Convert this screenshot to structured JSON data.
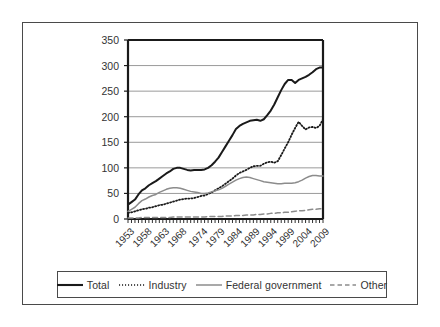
{
  "chart_data": {
    "type": "line",
    "title": "",
    "subtitle": "",
    "xlabel": "",
    "ylabel": "",
    "xlim": [
      1953,
      2009
    ],
    "ylim": [
      0,
      350
    ],
    "ytick_values": [
      0,
      50,
      100,
      150,
      200,
      250,
      300,
      350
    ],
    "ytick_labels": [
      "0",
      "50",
      "100",
      "150",
      "200",
      "250",
      "300",
      "350"
    ],
    "xtick_labels": [
      "1953",
      "1958",
      "1963",
      "1968",
      "1974",
      "1979",
      "1984",
      "1989",
      "1994",
      "1999",
      "2004",
      "2009"
    ],
    "xtick_values": [
      1953,
      1958,
      1963,
      1968,
      1974,
      1979,
      1984,
      1989,
      1994,
      1999,
      2004,
      2009
    ],
    "grid": "horizontal",
    "legend_position": "below",
    "x": [
      1953,
      1954,
      1955,
      1956,
      1957,
      1958,
      1959,
      1960,
      1961,
      1962,
      1963,
      1964,
      1965,
      1966,
      1967,
      1968,
      1969,
      1970,
      1971,
      1972,
      1973,
      1974,
      1975,
      1976,
      1977,
      1978,
      1979,
      1980,
      1981,
      1982,
      1983,
      1984,
      1985,
      1986,
      1987,
      1988,
      1989,
      1990,
      1991,
      1992,
      1993,
      1994,
      1995,
      1996,
      1997,
      1998,
      1999,
      2000,
      2001,
      2002,
      2003,
      2004,
      2005,
      2006,
      2007,
      2008,
      2009
    ],
    "series": [
      {
        "name": "Total",
        "style": "solid",
        "color": "#1a1a1a",
        "width": 2.0,
        "values": [
          28,
          33,
          38,
          48,
          56,
          60,
          66,
          70,
          74,
          79,
          84,
          89,
          93,
          98,
          100,
          100,
          98,
          96,
          95,
          96,
          96,
          96,
          97,
          100,
          105,
          112,
          120,
          131,
          142,
          153,
          164,
          176,
          182,
          186,
          189,
          192,
          193,
          194,
          192,
          195,
          203,
          212,
          224,
          238,
          252,
          264,
          272,
          272,
          266,
          272,
          275,
          278,
          282,
          287,
          293,
          296,
          296
        ]
      },
      {
        "name": "Industry",
        "style": "dotted",
        "color": "#1a1a1a",
        "width": 1.8,
        "values": [
          12,
          13,
          15,
          17,
          19,
          20,
          22,
          23,
          25,
          27,
          28,
          30,
          32,
          34,
          36,
          38,
          39,
          40,
          40,
          41,
          43,
          45,
          46,
          49,
          52,
          56,
          60,
          64,
          69,
          74,
          79,
          85,
          90,
          93,
          96,
          100,
          103,
          104,
          104,
          108,
          111,
          112,
          110,
          113,
          125,
          138,
          150,
          165,
          178,
          190,
          182,
          175,
          179,
          180,
          178,
          182,
          195
        ]
      },
      {
        "name": "Federal government",
        "style": "solid",
        "color": "#8c8c8c",
        "width": 1.5,
        "values": [
          15,
          19,
          23,
          30,
          36,
          39,
          43,
          46,
          48,
          52,
          55,
          58,
          60,
          61,
          61,
          60,
          58,
          56,
          54,
          53,
          52,
          50,
          50,
          51,
          53,
          55,
          57,
          60,
          64,
          68,
          72,
          76,
          79,
          81,
          82,
          81,
          79,
          77,
          75,
          73,
          72,
          71,
          70,
          69,
          69,
          70,
          70,
          70,
          71,
          73,
          76,
          80,
          83,
          85,
          85,
          84,
          84
        ]
      },
      {
        "name": "Other",
        "style": "dashed",
        "color": "#8c8c8c",
        "width": 1.5,
        "values": [
          2,
          2,
          2,
          2,
          3,
          3,
          3,
          3,
          3,
          3,
          3,
          3,
          3,
          4,
          4,
          4,
          4,
          4,
          4,
          4,
          4,
          4,
          4,
          5,
          5,
          5,
          5,
          5,
          6,
          6,
          6,
          7,
          7,
          7,
          8,
          8,
          8,
          9,
          9,
          10,
          10,
          11,
          11,
          12,
          12,
          13,
          13,
          14,
          15,
          16,
          16,
          17,
          18,
          19,
          19,
          20,
          20
        ]
      }
    ]
  },
  "legend": {
    "items": [
      {
        "label": "Total",
        "style": "solid-thick",
        "color": "#1a1a1a"
      },
      {
        "label": "Industry",
        "style": "dotted",
        "color": "#1a1a1a"
      },
      {
        "label": "Federal government",
        "style": "solid-thin",
        "color": "#8c8c8c"
      },
      {
        "label": "Other",
        "style": "dashed",
        "color": "#8c8c8c"
      }
    ]
  },
  "colors": {
    "frame": "#4a4a4a",
    "axis": "#1a1a1a",
    "grid": "#9a9a9a",
    "background": "#ffffff",
    "text": "#333333"
  }
}
